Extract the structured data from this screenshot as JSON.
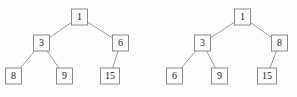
{
  "figure": {
    "background_color": "#fefefe",
    "node_fill": "#fdfdfd",
    "node_border_color": "#7e7e7e",
    "edge_color": "#8d8d8d",
    "label_color": "#1b1b1b"
  },
  "chart_data": {
    "type": "diagram",
    "subtype": "binary-tree",
    "title": "",
    "trees": [
      {
        "name": "left-tree",
        "root": "1",
        "nodes": [
          {
            "id": "L1",
            "label": "1",
            "x": 79.5,
            "y": 17,
            "w": 16,
            "h": 16
          },
          {
            "id": "L3",
            "label": "3",
            "x": 41.5,
            "y": 43,
            "w": 16,
            "h": 16
          },
          {
            "id": "L6",
            "label": "6",
            "x": 120.5,
            "y": 43,
            "w": 16,
            "h": 16
          },
          {
            "id": "L8",
            "label": "8",
            "x": 13.5,
            "y": 76,
            "w": 16,
            "h": 16
          },
          {
            "id": "L9",
            "label": "9",
            "x": 64.5,
            "y": 76,
            "w": 16,
            "h": 16
          },
          {
            "id": "L15",
            "label": "15",
            "x": 110.0,
            "y": 76,
            "w": 19,
            "h": 16
          }
        ],
        "edges": [
          {
            "from": "L1",
            "to": "L3"
          },
          {
            "from": "L1",
            "to": "L6"
          },
          {
            "from": "L3",
            "to": "L8"
          },
          {
            "from": "L3",
            "to": "L9"
          },
          {
            "from": "L6",
            "to": "L15"
          }
        ]
      },
      {
        "name": "right-tree",
        "root": "1",
        "nodes": [
          {
            "id": "R1",
            "label": "1",
            "x": 242.5,
            "y": 17,
            "w": 16,
            "h": 16
          },
          {
            "id": "R3",
            "label": "3",
            "x": 202.5,
            "y": 43,
            "w": 16,
            "h": 16
          },
          {
            "id": "R8",
            "label": "8",
            "x": 279.5,
            "y": 43,
            "w": 16,
            "h": 16
          },
          {
            "id": "R6",
            "label": "6",
            "x": 174.5,
            "y": 76,
            "w": 16,
            "h": 16
          },
          {
            "id": "R9",
            "label": "9",
            "x": 219.5,
            "y": 76,
            "w": 16,
            "h": 16
          },
          {
            "id": "R15",
            "label": "15",
            "x": 267.0,
            "y": 76,
            "w": 19,
            "h": 16
          }
        ],
        "edges": [
          {
            "from": "R1",
            "to": "R3"
          },
          {
            "from": "R1",
            "to": "R8"
          },
          {
            "from": "R3",
            "to": "R6"
          },
          {
            "from": "R3",
            "to": "R9"
          },
          {
            "from": "R8",
            "to": "R15"
          }
        ]
      }
    ]
  }
}
